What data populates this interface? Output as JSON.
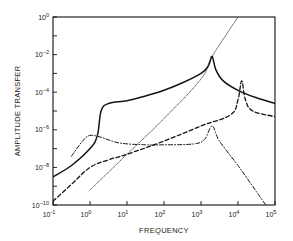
{
  "chart_data": {
    "type": "line",
    "title": "",
    "xlabel": "FREQUENCY",
    "ylabel": "AMPLITUDE TRANSFER",
    "xscale": "log",
    "yscale": "log",
    "xlim": [
      0.1,
      100000
    ],
    "ylim": [
      1e-10,
      1
    ],
    "grid": false,
    "legend": null,
    "x_ticks": [
      {
        "exp": "-1",
        "base": "10"
      },
      {
        "exp": "0",
        "base": "10"
      },
      {
        "exp": "1",
        "base": "10"
      },
      {
        "exp": "2",
        "base": "10"
      },
      {
        "exp": "3",
        "base": "10"
      },
      {
        "exp": "4",
        "base": "10"
      },
      {
        "exp": "5",
        "base": "10"
      }
    ],
    "y_ticks": [
      {
        "exp": "0",
        "base": "10"
      },
      {
        "exp": "-2",
        "base": "10"
      },
      {
        "exp": "-4",
        "base": "10"
      },
      {
        "exp": "-6",
        "base": "10"
      },
      {
        "exp": "-8",
        "base": "10"
      },
      {
        "exp": "-10",
        "base": "10"
      }
    ],
    "series": [
      {
        "name": "solid",
        "style": "solid",
        "log_x": [
          -1,
          -0.5,
          0,
          0.2,
          0.3,
          0.5,
          1,
          1.5,
          2,
          2.5,
          3,
          3.2,
          3.3,
          3.4,
          3.6,
          4,
          4.5,
          5
        ],
        "log_y": [
          -8.5,
          -7.9,
          -7.0,
          -6.3,
          -5.0,
          -4.6,
          -4.45,
          -4.2,
          -3.9,
          -3.5,
          -3.0,
          -2.6,
          -2.1,
          -2.8,
          -3.4,
          -3.9,
          -4.3,
          -4.6
        ]
      },
      {
        "name": "dotted",
        "style": "dotted",
        "log_x": [
          0,
          1,
          2,
          3,
          3.3,
          4.0
        ],
        "log_y": [
          -9.2,
          -7.3,
          -5.4,
          -3.3,
          -2.1,
          0
        ]
      },
      {
        "name": "dashed",
        "style": "dashed",
        "log_x": [
          -1,
          -0.5,
          0,
          0.5,
          1,
          2,
          3,
          3.8,
          4.0,
          4.1,
          4.2,
          4.4,
          5
        ],
        "log_y": [
          -9.8,
          -8.9,
          -8.0,
          -7.6,
          -7.3,
          -6.6,
          -5.8,
          -5.2,
          -4.4,
          -3.4,
          -4.4,
          -5.0,
          -5.3
        ]
      },
      {
        "name": "dash-dot",
        "style": "dashdot",
        "log_x": [
          -0.5,
          -0.2,
          0,
          0.3,
          0.8,
          1.5,
          2,
          2.8,
          3.1,
          3.3,
          3.5,
          4,
          4.5,
          4.75
        ],
        "log_y": [
          -7.4,
          -6.6,
          -6.3,
          -6.4,
          -6.7,
          -6.8,
          -6.8,
          -6.75,
          -6.5,
          -5.8,
          -6.6,
          -7.9,
          -9.3,
          -10
        ]
      }
    ]
  }
}
